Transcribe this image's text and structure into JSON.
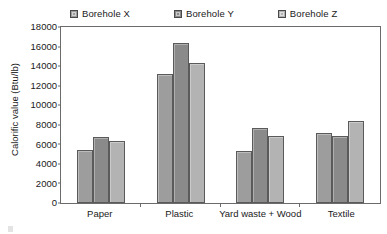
{
  "chart_data": {
    "type": "bar",
    "title": "",
    "xlabel": "",
    "ylabel": "Calorific value (Btu/lb)",
    "categories": [
      "Paper",
      "Plastic",
      "Yard waste + Wood",
      "Textile"
    ],
    "series": [
      {
        "name": "Borehole X",
        "color": "#9d9d9d",
        "values": [
          5400,
          13150,
          5300,
          7150
        ]
      },
      {
        "name": "Borehole Y",
        "color": "#8a8a8a",
        "values": [
          6750,
          16400,
          7650,
          6850
        ]
      },
      {
        "name": "Borehole Z",
        "color": "#b3b3b3",
        "values": [
          6350,
          14350,
          6900,
          8400
        ]
      }
    ],
    "ylim": [
      0,
      18000
    ],
    "ytick_values": [
      0,
      2000,
      4000,
      6000,
      8000,
      10000,
      12000,
      14000,
      16000,
      18000
    ],
    "ytick_labels": [
      "0",
      "2000",
      "4000",
      "6000",
      "8000",
      "10000",
      "12000",
      "14000",
      "16000",
      "18000"
    ],
    "grid": false,
    "legend_position": "top",
    "axis_color": "#6b6b6b",
    "bar_edge_color": "#5a5a5a",
    "background": "#ffffff"
  },
  "legend": {
    "items": [
      {
        "label": "Borehole X",
        "swatch_color": "#9d9d9d"
      },
      {
        "label": "Borehole Y",
        "swatch_color": "#8a8a8a"
      },
      {
        "label": "Borehole Z",
        "swatch_color": "#b3b3b3"
      }
    ]
  }
}
